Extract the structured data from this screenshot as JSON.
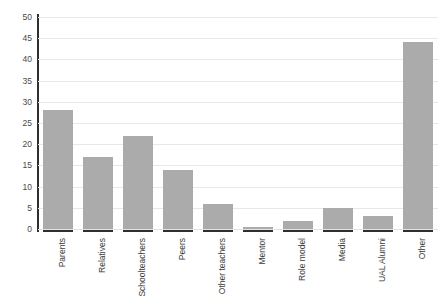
{
  "chart_data": {
    "type": "bar",
    "title": "",
    "xlabel": "",
    "ylabel": "",
    "ylim": [
      0,
      50
    ],
    "yticks": [
      0,
      5,
      10,
      15,
      20,
      25,
      30,
      35,
      40,
      45,
      50
    ],
    "grid": true,
    "legend": "none",
    "bar_color": "#ababab",
    "axis_color": "#2f2f2f",
    "gridline_color": "#e8e8e8",
    "categories": [
      "Parents",
      "Relatives",
      "Schoolteachers",
      "Peers",
      "Other teachers",
      "Mentor",
      "Role model",
      "Media",
      "UAL Alumni",
      "Other"
    ],
    "values": [
      28,
      17,
      22,
      14,
      6,
      0.5,
      2,
      5,
      3,
      44
    ]
  }
}
